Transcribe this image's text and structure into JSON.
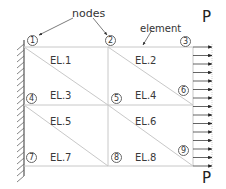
{
  "diagram": {
    "type": "finite-element-mesh",
    "annotations": {
      "nodes_label": "nodes",
      "element_label": "element"
    },
    "load": {
      "top_label": "P",
      "bottom_label": "P",
      "arrow_count": 14
    },
    "nodes": [
      {
        "id": "1",
        "x": 32,
        "y": 40
      },
      {
        "id": "2",
        "x": 110,
        "y": 40
      },
      {
        "id": "3",
        "x": 185,
        "y": 41
      },
      {
        "id": "4",
        "x": 31,
        "y": 98
      },
      {
        "id": "5",
        "x": 116,
        "y": 98
      },
      {
        "id": "6",
        "x": 183,
        "y": 90
      },
      {
        "id": "7",
        "x": 31,
        "y": 157
      },
      {
        "id": "8",
        "x": 116,
        "y": 157
      },
      {
        "id": "9",
        "x": 183,
        "y": 150
      }
    ],
    "elements": [
      {
        "label": "EL.1",
        "x": 50,
        "y": 56
      },
      {
        "label": "EL.2",
        "x": 135,
        "y": 56
      },
      {
        "label": "EL.3",
        "x": 50,
        "y": 91
      },
      {
        "label": "EL.4",
        "x": 135,
        "y": 91
      },
      {
        "label": "EL.5",
        "x": 50,
        "y": 117
      },
      {
        "label": "EL.6",
        "x": 135,
        "y": 117
      },
      {
        "label": "EL.7",
        "x": 50,
        "y": 153
      },
      {
        "label": "EL.8",
        "x": 135,
        "y": 153
      }
    ],
    "colors": {
      "mesh_line": "#c8c8c8",
      "wall": "#555555",
      "arrow": "#222222",
      "text": "#333333"
    }
  }
}
